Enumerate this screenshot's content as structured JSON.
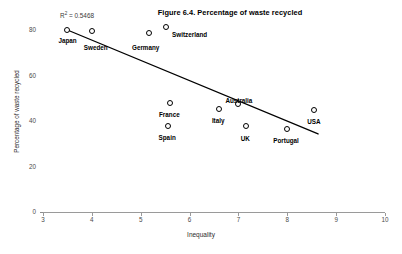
{
  "chart_data": {
    "type": "scatter",
    "title": "Figure 6.4. Percentage of waste recycled",
    "xlabel": "Inequality",
    "ylabel": "Percentage of waste recycled",
    "xlim": [
      3,
      10
    ],
    "ylim": [
      0,
      80
    ],
    "grid": false,
    "legend": "none",
    "annotations": [
      {
        "text": "R² = 0.5468",
        "r_label": "R",
        "sup": "2",
        "value_text": " = 0.5468"
      }
    ],
    "xticks": [
      3,
      4,
      5,
      6,
      7,
      8,
      9,
      10
    ],
    "yticks": [
      0,
      20,
      40,
      60,
      80
    ],
    "points": [
      {
        "label": "Japan",
        "x": 3.5,
        "y": 80.0,
        "label_dx": -9,
        "label_dy": 8
      },
      {
        "label": "Sweden",
        "x": 4.0,
        "y": 79.5,
        "label_dx": -8,
        "label_dy": 14
      },
      {
        "label": "Germany",
        "x": 5.17,
        "y": 78.7,
        "label_dx": -17,
        "label_dy": 12
      },
      {
        "label": "Switzerland",
        "x": 5.52,
        "y": 81.3,
        "label_dx": 6,
        "label_dy": 5
      },
      {
        "label": "France",
        "x": 5.6,
        "y": 47.9,
        "label_dx": -11,
        "label_dy": 9
      },
      {
        "label": "Spain",
        "x": 5.55,
        "y": 37.8,
        "label_dx": -9,
        "label_dy": 9
      },
      {
        "label": "Italy",
        "x": 6.6,
        "y": 45.3,
        "label_dx": -7,
        "label_dy": 9
      },
      {
        "label": "Australia",
        "x": 7.0,
        "y": 47.5,
        "label_dx": -13,
        "label_dy": -6
      },
      {
        "label": "UK",
        "x": 7.15,
        "y": 37.8,
        "label_dx": -5,
        "label_dy": 10
      },
      {
        "label": "Portugal",
        "x": 8.0,
        "y": 36.5,
        "label_dx": -14,
        "label_dy": 9
      },
      {
        "label": "USA",
        "x": 8.55,
        "y": 44.9,
        "label_dx": -7,
        "label_dy": 9
      }
    ],
    "trendline": {
      "x_start": 3.5,
      "y_start": 80.0,
      "x_end": 8.63,
      "y_end": 34.3
    },
    "r_squared": 0.5468
  },
  "axis": {
    "x_tick_labels": [
      "3",
      "4",
      "5",
      "6",
      "7",
      "8",
      "9",
      "10"
    ],
    "y_tick_labels": [
      "80",
      "60",
      "40",
      "20",
      "0"
    ]
  }
}
